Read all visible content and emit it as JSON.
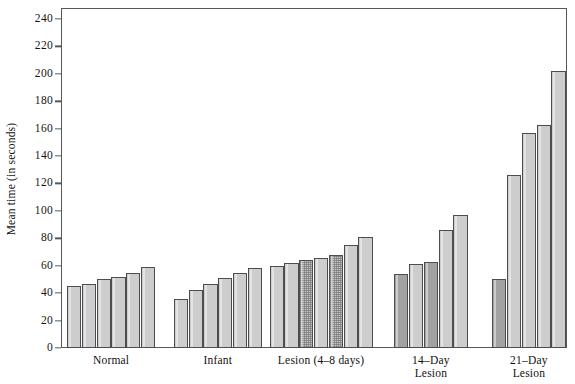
{
  "chart_data": {
    "type": "bar",
    "title": "",
    "xlabel": "",
    "ylabel": "Mean time (in seconds)",
    "ylim": [
      0,
      248
    ],
    "ytick_values": [
      0,
      20,
      40,
      60,
      80,
      100,
      120,
      140,
      160,
      180,
      200,
      220,
      240
    ],
    "ytick_labels": [
      "0",
      "20",
      "40",
      "60",
      "80",
      "100",
      "120",
      "140",
      "160",
      "180",
      "200",
      "220",
      "240"
    ],
    "grid": false,
    "legend": "none",
    "groups": [
      {
        "label": "Normal",
        "values": [
          45,
          47,
          50,
          52,
          55,
          59
        ],
        "styles": [
          "light",
          "light",
          "light",
          "light",
          "light",
          "light"
        ]
      },
      {
        "label": "Infant",
        "values": [
          36,
          42,
          47,
          51,
          55,
          58
        ],
        "styles": [
          "light",
          "light",
          "light",
          "light",
          "light",
          "light"
        ]
      },
      {
        "label": "Lesion (4–8 days)",
        "values": [
          60,
          62,
          64,
          66,
          68,
          75,
          81
        ],
        "styles": [
          "light",
          "light",
          "stipple",
          "light",
          "stipple",
          "light",
          "light"
        ]
      },
      {
        "label": "14–Day\nLesion",
        "values": [
          54,
          61,
          63,
          86,
          97
        ],
        "styles": [
          "dark",
          "light",
          "dark",
          "light",
          "light"
        ]
      },
      {
        "label": "21–Day\nLesion",
        "values": [
          50,
          126,
          157,
          163,
          202
        ],
        "styles": [
          "dark",
          "light",
          "light",
          "light",
          "light"
        ]
      }
    ],
    "colors": {
      "bar_light": "#cdcdcd",
      "bar_dark": "#a2a2a2",
      "bar_stipple": "#c2c2c2",
      "bar_edge": "#4a4d51",
      "axis": "#55585c",
      "background": "#ffffff",
      "text": "#111111"
    }
  }
}
